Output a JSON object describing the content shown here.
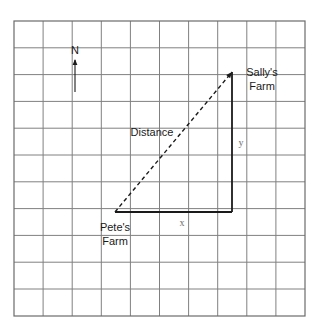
{
  "figure": {
    "background_color": "#ffffff",
    "grid": {
      "columns": 10,
      "rows": 11,
      "x0": 14,
      "y0": 21,
      "x1": 305,
      "y1": 316,
      "cell_width": 29.1,
      "cell_height": 26.8,
      "line_color": "#808080",
      "border_color": "#6b6b6b",
      "line_width": 1
    },
    "compass": {
      "label": "N",
      "label_x": 75,
      "label_y": 54,
      "arrow_x": 75,
      "arrow_top_y": 60,
      "arrow_bottom_y": 92,
      "color": "#1a1a1a"
    },
    "points": [
      {
        "id": "petes-farm",
        "label_line1": "Pete's",
        "label_line2": "Farm",
        "x": 115,
        "y": 212,
        "label_x": 115,
        "label_y1": 231,
        "label_y2": 245
      },
      {
        "id": "sallys-farm",
        "label_line1": "Sally's",
        "label_line2": "Farm",
        "x": 232,
        "y": 72,
        "label_x": 262,
        "label_y1": 76,
        "label_y2": 90
      }
    ],
    "segments": [
      {
        "id": "distance-hypotenuse",
        "label": "Distance",
        "label_x": 152,
        "label_y": 136,
        "style": "dashed",
        "dash_pattern": "4,3",
        "color": "#1a1a1a",
        "width": 1.4,
        "from_x": 115,
        "from_y": 212,
        "to_x": 232,
        "to_y": 72
      },
      {
        "id": "x-leg",
        "label": "x",
        "label_x": 182,
        "label_y": 226,
        "style": "solid",
        "color": "#1a1a1a",
        "width": 1.8,
        "from_x": 115,
        "from_y": 212,
        "to_x": 232,
        "to_y": 212
      },
      {
        "id": "y-leg",
        "label": "y",
        "label_x": 241,
        "label_y": 146,
        "style": "solid",
        "color": "#1a1a1a",
        "width": 1.8,
        "from_x": 232,
        "from_y": 212,
        "to_x": 232,
        "to_y": 72
      }
    ]
  }
}
